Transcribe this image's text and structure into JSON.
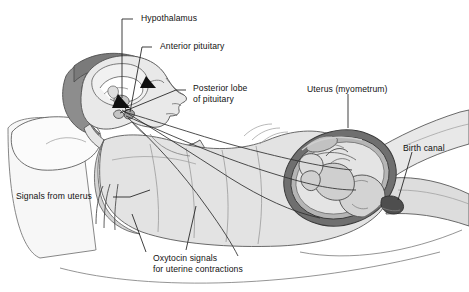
{
  "palette": {
    "line": "#3a3a3a",
    "outline": "#555555",
    "skin_light": "#e8e8e8",
    "skin_mid": "#cfcfcf",
    "hair_dark": "#8d8d8d",
    "hair_darker": "#6f6f6f",
    "gown": "#e1e1e1",
    "gown_shade": "#cdcdcd",
    "bed": "#f4f4f4",
    "pillow": "#f7f7f7",
    "uterus_wall": "#7b7b7b",
    "uterus_inner": "#b9b9b9",
    "fetus": "#d6d6d6",
    "fetus_shade": "#ababab",
    "arrow": "#111111",
    "text": "#111111",
    "background": "#ffffff"
  },
  "labels": [
    {
      "id": "hypothalamus",
      "text": "Hypothalamus",
      "x": 141,
      "y": 14,
      "lines": [
        "Hypothalamus"
      ]
    },
    {
      "id": "anterior-pituitary",
      "text": "Anterior pituitary",
      "x": 160,
      "y": 42,
      "lines": [
        "Anterior pituitary"
      ]
    },
    {
      "id": "posterior-lobe",
      "text": "Posterior lobe of pituitary",
      "x": 193,
      "y": 85,
      "lines": [
        "Posterior lobe",
        "of pituitary"
      ]
    },
    {
      "id": "uterus-myometrium",
      "text": "Uterus (myometrum)",
      "x": 307,
      "y": 85,
      "lines": [
        "Uterus (myometrum)"
      ]
    },
    {
      "id": "birth-canal",
      "text": "Birth canal",
      "x": 403,
      "y": 144,
      "lines": [
        "Birth canal"
      ]
    },
    {
      "id": "signals-from-uterus",
      "text": "Signals from uterus",
      "x": 16,
      "y": 192,
      "lines": [
        "Signals from uterus"
      ]
    },
    {
      "id": "oxytocin-signals",
      "text": "Oxytocin signals for uterine contractions",
      "x": 153,
      "y": 255,
      "lines": [
        "Oxytocin signals",
        "for uterine contractions"
      ]
    }
  ],
  "anatomy": [
    {
      "name": "hypothalamus",
      "kind": "brain-region"
    },
    {
      "name": "anterior-pituitary",
      "kind": "gland"
    },
    {
      "name": "posterior-pituitary",
      "kind": "gland"
    },
    {
      "name": "uterus-myometrium",
      "kind": "muscle"
    },
    {
      "name": "birth-canal",
      "kind": "passage"
    },
    {
      "name": "fetus",
      "kind": "fetus"
    },
    {
      "name": "pillow",
      "kind": "bedding"
    },
    {
      "name": "bed",
      "kind": "bedding"
    },
    {
      "name": "hospital-gown",
      "kind": "clothing"
    }
  ],
  "signal_paths": [
    {
      "id": "afferent-uterus-to-brain",
      "direction": "uterus-to-hypothalamus",
      "label_ref": "signals-from-uterus"
    },
    {
      "id": "efferent-oxytocin",
      "direction": "pituitary-to-uterus",
      "label_ref": "oxytocin-signals"
    }
  ]
}
